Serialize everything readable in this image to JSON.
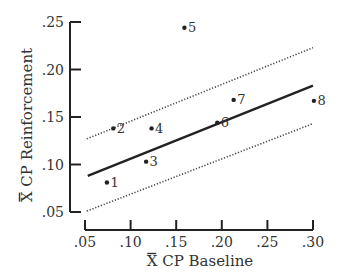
{
  "chart_data": {
    "type": "scatter",
    "title": "",
    "xlabel": "X CP Baseline",
    "ylabel": "X CP Reinforcement",
    "xlabel_bar": "X",
    "ylabel_bar": "X",
    "xlim": [
      0.05,
      0.3
    ],
    "ylim": [
      0.05,
      0.25
    ],
    "x_ticks": [
      0.05,
      0.1,
      0.15,
      0.2,
      0.25,
      0.3
    ],
    "x_tick_labels": [
      ".05",
      ".10",
      ".15",
      ".20",
      ".25",
      ".30"
    ],
    "y_ticks": [
      0.05,
      0.1,
      0.15,
      0.2,
      0.25
    ],
    "y_tick_labels": [
      ".05",
      ".10",
      ".15",
      ".20",
      ".25"
    ],
    "grid": false,
    "legend": null,
    "points": [
      {
        "label": "1",
        "x": 0.074,
        "y": 0.081
      },
      {
        "label": "2",
        "x": 0.081,
        "y": 0.138
      },
      {
        "label": "3",
        "x": 0.117,
        "y": 0.103
      },
      {
        "label": "4",
        "x": 0.123,
        "y": 0.138
      },
      {
        "label": "5",
        "x": 0.159,
        "y": 0.244
      },
      {
        "label": "6",
        "x": 0.195,
        "y": 0.144
      },
      {
        "label": "7",
        "x": 0.213,
        "y": 0.168
      },
      {
        "label": "8",
        "x": 0.301,
        "y": 0.167
      }
    ],
    "regression_line": {
      "style": "solid",
      "x": [
        0.053,
        0.3
      ],
      "y": [
        0.088,
        0.183
      ]
    },
    "upper_band": {
      "style": "dotted",
      "x": [
        0.052,
        0.3
      ],
      "y": [
        0.127,
        0.223
      ]
    },
    "lower_band": {
      "style": "dotted",
      "x": [
        0.052,
        0.3
      ],
      "y": [
        0.051,
        0.143
      ]
    }
  },
  "layout": {
    "plot_left_px": 85,
    "plot_right_px": 313,
    "plot_top_px": 22,
    "plot_bottom_px": 212,
    "y_axis_x_px": 70,
    "x_axis_y_px": 230,
    "line_color": "#222222"
  }
}
